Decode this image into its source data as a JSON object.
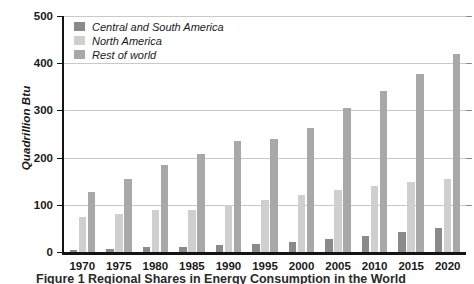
{
  "chart_data": {
    "type": "bar",
    "title": "",
    "xlabel": "",
    "ylabel": "Quadrillion Btu",
    "ylim": [
      0,
      500
    ],
    "yticks": [
      0,
      100,
      200,
      300,
      400,
      500
    ],
    "grid": true,
    "legend_position": "top-left",
    "categories": [
      "1970",
      "1975",
      "1980",
      "1985",
      "1990",
      "1995",
      "2000",
      "2005",
      "2010",
      "2015",
      "2020"
    ],
    "series": [
      {
        "name": "Central and South America",
        "color": "#8a8a8a",
        "values": [
          5,
          6,
          10,
          11,
          14,
          17,
          21,
          27,
          33,
          43,
          50
        ]
      },
      {
        "name": "North America",
        "color": "#cfcfcf",
        "values": [
          75,
          81,
          89,
          88,
          99,
          110,
          121,
          131,
          139,
          148,
          155
        ]
      },
      {
        "name": "Rest of world",
        "color": "#a8a8a8",
        "values": [
          127,
          155,
          184,
          207,
          235,
          239,
          263,
          305,
          341,
          378,
          420
        ]
      }
    ]
  },
  "axis": {
    "ytick_labels": [
      "0",
      "100",
      "200",
      "300",
      "400",
      "500"
    ]
  },
  "legend": {
    "entries": [
      {
        "label": "Central and South America"
      },
      {
        "label": "North America"
      },
      {
        "label": "Rest of world"
      }
    ]
  },
  "caption": {
    "text": "Figure 1    Regional Shares in Energy Consumption in the World"
  },
  "colors": {
    "series_dark": "#8a8a8a",
    "series_light": "#cfcfcf",
    "series_mid": "#a8a8a8",
    "axis": "#141414",
    "gridline": "#c9c9c9",
    "background": "#ffffff"
  }
}
